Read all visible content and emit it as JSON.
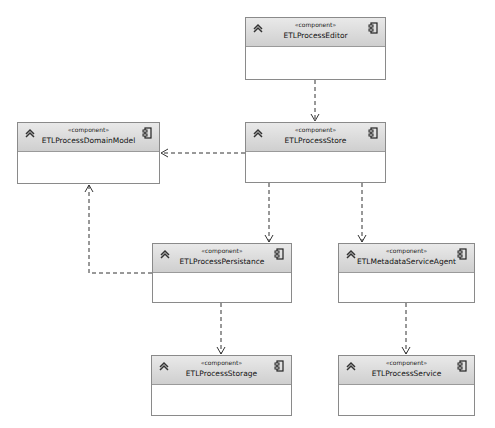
{
  "diagram": {
    "type": "UML component diagram",
    "components": [
      {
        "id": "editor",
        "stereotype": "«component»",
        "name": "ETLProcessEditor",
        "box": [
          245,
          17,
          141,
          63
        ]
      },
      {
        "id": "domain",
        "stereotype": "«component»",
        "name": "ETLProcessDomainModel",
        "box": [
          17,
          122,
          143,
          62
        ]
      },
      {
        "id": "store",
        "stereotype": "«component»",
        "name": "ETLProcessStore",
        "box": [
          245,
          122,
          141,
          61
        ]
      },
      {
        "id": "persist",
        "stereotype": "«component»",
        "name": "ETLProcessPersistance",
        "box": [
          152,
          243,
          140,
          60
        ]
      },
      {
        "id": "agent",
        "stereotype": "«component»",
        "name": "ETLMetadataServiceAgent",
        "box": [
          338,
          243,
          137,
          60
        ]
      },
      {
        "id": "storage",
        "stereotype": "«component»",
        "name": "ETLProcessStorage",
        "box": [
          151,
          355,
          141,
          61
        ]
      },
      {
        "id": "service",
        "stereotype": "«component»",
        "name": "ETLProcessService",
        "box": [
          338,
          355,
          137,
          61
        ]
      }
    ],
    "dependencies": [
      {
        "from": "ETLProcessEditor",
        "to": "ETLProcessStore"
      },
      {
        "from": "ETLProcessStore",
        "to": "ETLProcessDomainModel"
      },
      {
        "from": "ETLProcessStore",
        "to": "ETLProcessPersistance"
      },
      {
        "from": "ETLProcessStore",
        "to": "ETLMetadataServiceAgent"
      },
      {
        "from": "ETLProcessPersistance",
        "to": "ETLProcessDomainModel"
      },
      {
        "from": "ETLProcessPersistance",
        "to": "ETLProcessStorage"
      },
      {
        "from": "ETLMetadataServiceAgent",
        "to": "ETLProcessService"
      }
    ],
    "colors": {
      "header_top": "#e9e9e9",
      "header_bottom": "#cfcfcf",
      "border": "#8a8a8a",
      "line": "#333333"
    }
  }
}
